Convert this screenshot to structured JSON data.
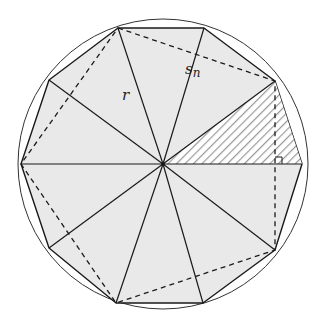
{
  "diagram": {
    "labels": {
      "radius": "r",
      "side": "s",
      "side_subscript": "n"
    },
    "colors": {
      "fill": "#e9e9e9",
      "stroke": "#1a1a1a",
      "hatch": "#9a9a9a",
      "background": "#ffffff"
    },
    "geometry": {
      "center": [
        163,
        164
      ],
      "circle_radius": 145,
      "polygon_radius": 141,
      "sides": 10
    }
  }
}
